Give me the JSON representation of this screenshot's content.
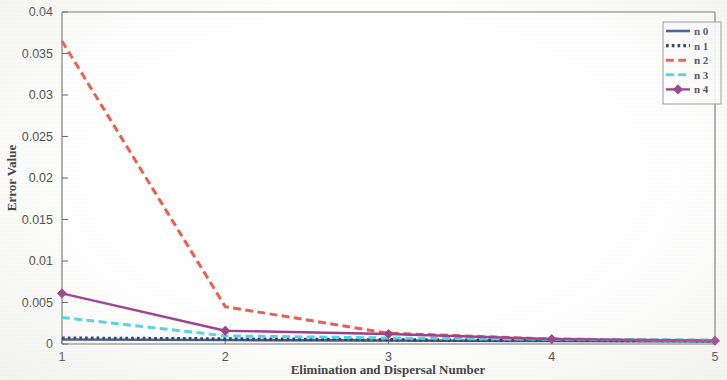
{
  "figure": {
    "background_color": "#fdfdfb",
    "axis_color": "#6e6e6e"
  },
  "chart_data": {
    "type": "line",
    "title": "",
    "xlabel": "Elimination and Dispersal Number",
    "ylabel": "Error Value",
    "xlim": [
      1,
      5
    ],
    "ylim": [
      0,
      0.04
    ],
    "xticks": [
      "1",
      "2",
      "3",
      "4",
      "5"
    ],
    "xtick_values": [
      1,
      2,
      3,
      4,
      5
    ],
    "yticks": [
      "0",
      "0.005",
      "0.01",
      "0.015",
      "0.02",
      "0.025",
      "0.03",
      "0.035",
      "0.04"
    ],
    "ytick_values": [
      0,
      0.005,
      0.01,
      0.015,
      0.02,
      0.025,
      0.03,
      0.035,
      0.04
    ],
    "grid": false,
    "legend_position": "upper right",
    "x": [
      1,
      2,
      3,
      4,
      5
    ],
    "series": [
      {
        "name": "n  0",
        "color": "#3d5a8c",
        "style": "solid",
        "marker": "none",
        "width": 2.6,
        "values": [
          0.00055,
          0.00048,
          0.00042,
          0.00036,
          0.0003
        ]
      },
      {
        "name": "n  1",
        "color": "#2f3d5c",
        "style": "dotted",
        "marker": "none",
        "width": 3.2,
        "values": [
          0.00072,
          0.00062,
          0.00052,
          0.00044,
          0.00038
        ]
      },
      {
        "name": "n  2",
        "color": "#e8604c",
        "style": "dashed",
        "marker": "none",
        "width": 3.0,
        "values": [
          0.0365,
          0.0045,
          0.0013,
          0.0006,
          0.00042
        ]
      },
      {
        "name": "n  3",
        "color": "#4fd6e6",
        "style": "dashed",
        "marker": "none",
        "width": 3.0,
        "values": [
          0.0032,
          0.00098,
          0.00072,
          0.00058,
          0.00048
        ]
      },
      {
        "name": "n  4",
        "color": "#9c3f8e",
        "style": "solid",
        "marker": "diamond",
        "width": 2.4,
        "values": [
          0.0061,
          0.0016,
          0.0012,
          0.0006,
          0.0004
        ]
      }
    ],
    "legend_entries": [
      {
        "label": "n  0",
        "color": "#3d5a8c",
        "style": "solid",
        "marker": "none"
      },
      {
        "label": "n  1",
        "color": "#2f3d5c",
        "style": "dotted",
        "marker": "none"
      },
      {
        "label": "n  2",
        "color": "#e8604c",
        "style": "dashed",
        "marker": "none"
      },
      {
        "label": "n  3",
        "color": "#4fd6e6",
        "style": "dashed",
        "marker": "none"
      },
      {
        "label": "n  4",
        "color": "#9c3f8e",
        "style": "solid",
        "marker": "diamond"
      }
    ]
  }
}
